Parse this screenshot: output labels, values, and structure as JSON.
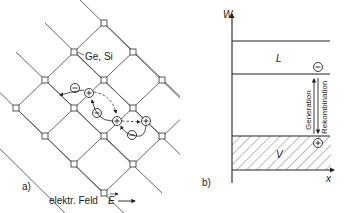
{
  "panel_a": {
    "label": "a)",
    "lattice_label": "Ge, Si",
    "field_label": "elektr. Feld",
    "field_symbol": "E",
    "charges": {
      "minus": "−",
      "plus": "+"
    }
  },
  "panel_b": {
    "label": "b)",
    "y_axis_label": "W",
    "x_axis_label": "x",
    "conduction_band_label": "L",
    "valence_band_label": "V",
    "generation_label": "Generation",
    "recombination_label": "Rekombination",
    "electron_symbol": "−",
    "hole_symbol": "+"
  },
  "colors": {
    "line": "#333333",
    "background": "#ffffff"
  }
}
